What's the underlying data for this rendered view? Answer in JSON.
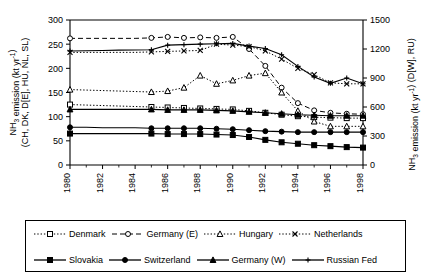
{
  "chart_data": {
    "type": "line",
    "title": "",
    "xlabel": "",
    "ylabel": "NH3 emission (kt yr-1) (CH, DK, D[E], HU, NL, SL)",
    "y2label": "NH3 emission (kt yr-1) (D[W], RU)",
    "grid": false,
    "legend_position": "below",
    "xlim": [
      1980,
      1998
    ],
    "ylim": [
      0,
      300
    ],
    "y2lim": [
      0,
      1500
    ],
    "x": [
      1980,
      1981,
      1982,
      1983,
      1984,
      1985,
      1986,
      1987,
      1988,
      1989,
      1990,
      1991,
      1992,
      1993,
      1994,
      1995,
      1996,
      1997,
      1998
    ],
    "xticks": [
      1980,
      1982,
      1984,
      1986,
      1988,
      1990,
      1992,
      1994,
      1996,
      1998
    ],
    "yticks": [
      0,
      50,
      100,
      150,
      200,
      250,
      300
    ],
    "y2ticks": [
      0,
      300,
      600,
      900,
      1200,
      1500
    ],
    "series": [
      {
        "name": "Denmark",
        "axis": "left",
        "marker": "open-square",
        "line": "dotted",
        "values": [
          125,
          124,
          123,
          122,
          121,
          120,
          119,
          118,
          117,
          116,
          115,
          112,
          108,
          104,
          101,
          99,
          98,
          97,
          97
        ]
      },
      {
        "name": "Germany (E)",
        "axis": "left",
        "marker": "open-circle",
        "line": "dashed",
        "values": [
          262,
          262,
          262,
          262,
          262,
          263,
          265,
          263,
          264,
          263,
          265,
          240,
          205,
          160,
          128,
          113,
          108,
          106,
          105
        ]
      },
      {
        "name": "Hungary",
        "axis": "left",
        "marker": "open-triangle",
        "line": "dotted",
        "values": [
          156,
          155,
          154,
          153,
          152,
          151,
          153,
          160,
          185,
          168,
          175,
          185,
          190,
          150,
          112,
          90,
          80,
          80,
          80
        ]
      },
      {
        "name": "Netherlands",
        "axis": "left",
        "marker": "x",
        "line": "dotted",
        "values": [
          233,
          233,
          233,
          233,
          233,
          234,
          235,
          236,
          237,
          250,
          248,
          245,
          236,
          219,
          200,
          187,
          170,
          168,
          168
        ]
      },
      {
        "name": "Slovakia",
        "axis": "left",
        "marker": "filled-square",
        "line": "solid",
        "values": [
          65,
          65,
          65,
          65,
          65,
          65,
          64,
          64,
          64,
          63,
          62,
          58,
          52,
          47,
          44,
          41,
          39,
          37,
          36
        ]
      },
      {
        "name": "Switzerland",
        "axis": "left",
        "marker": "filled-circle",
        "line": "solid",
        "values": [
          78,
          78,
          77,
          77,
          77,
          76,
          76,
          76,
          76,
          75,
          74,
          72,
          70,
          69,
          68,
          68,
          68,
          68,
          68
        ]
      },
      {
        "name": "Germany (W)",
        "axis": "left",
        "marker": "filled-triangle",
        "line": "solid",
        "values": [
          115,
          115,
          115,
          115,
          115,
          115,
          114,
          114,
          114,
          113,
          112,
          110,
          108,
          106,
          104,
          103,
          102,
          102,
          102
        ]
      },
      {
        "name": "Russian Fed",
        "axis": "right",
        "marker": "plus",
        "line": "solid",
        "values": [
          1180,
          1182,
          1185,
          1188,
          1190,
          1192,
          1240,
          1245,
          1250,
          1255,
          1258,
          1230,
          1205,
          1140,
          1020,
          910,
          845,
          900,
          840
        ]
      }
    ]
  },
  "axes": {
    "y_left_line1": "NH",
    "y_left_sub": "3",
    "y_left_line1b": " emission (kt yr",
    "y_left_sup": "-1",
    "y_left_line1c": ")",
    "y_left_line2": "(CH, DK, D[E], HU, NL, SL)",
    "y_right_a": "NH",
    "y_right_sub": "3",
    "y_right_b": " emission (kt yr",
    "y_right_sup": "-1",
    "y_right_c": ") (D[W], RU)"
  },
  "legend": {
    "rows": [
      [
        {
          "label": "Denmark",
          "marker": "open-square",
          "line": "dotted"
        },
        {
          "label": "Germany (E)",
          "marker": "open-circle",
          "line": "dashed"
        },
        {
          "label": "Hungary",
          "marker": "open-triangle",
          "line": "dotted"
        },
        {
          "label": "Netherlands",
          "marker": "x",
          "line": "dotted"
        }
      ],
      [
        {
          "label": "Slovakia",
          "marker": "filled-square",
          "line": "solid"
        },
        {
          "label": "Switzerland",
          "marker": "filled-circle",
          "line": "solid"
        },
        {
          "label": "Germany (W)",
          "marker": "filled-triangle",
          "line": "solid"
        },
        {
          "label": "Russian Fed",
          "marker": "plus",
          "line": "solid"
        }
      ]
    ]
  }
}
